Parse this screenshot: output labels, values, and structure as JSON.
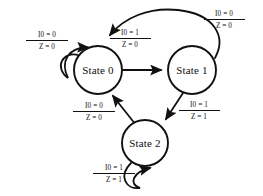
{
  "diagram": {
    "type": "finite-state-machine",
    "background_color": "#ffffff",
    "stroke_color": "#111111",
    "text_color": "#101010"
  },
  "states": [
    {
      "id": "state0",
      "label": "State 0",
      "cx": 98,
      "cy": 70,
      "r": 24
    },
    {
      "id": "state1",
      "label": "State 1",
      "cx": 192,
      "cy": 70,
      "r": 24
    },
    {
      "id": "state2",
      "label": "State 2",
      "cx": 145,
      "cy": 143,
      "r": 23
    }
  ],
  "transitions": [
    {
      "id": "t0",
      "from": "state0",
      "to": "state0",
      "kind": "self-loop",
      "input": "I0 = 0",
      "output": "Z = 0",
      "label_x": 47,
      "label_y": 40
    },
    {
      "id": "t1",
      "from": "state0",
      "to": "state1",
      "kind": "straight",
      "input": "I0 = 1",
      "output": "Z = 0",
      "label_x": 130,
      "label_y": 38
    },
    {
      "id": "t2",
      "from": "state1",
      "to": "state0",
      "kind": "arc",
      "input": "I0 = 0",
      "output": "Z = 0",
      "label_x": 222,
      "label_y": 19
    },
    {
      "id": "t3",
      "from": "state1",
      "to": "state2",
      "kind": "straight",
      "input": "I0 = 1",
      "output": "Z = 1",
      "label_x": 197,
      "label_y": 110
    },
    {
      "id": "t4",
      "from": "state2",
      "to": "state0",
      "kind": "straight",
      "input": "I0 = 0",
      "output": "Z = 0",
      "label_x": 94,
      "label_y": 111
    },
    {
      "id": "t5",
      "from": "state2",
      "to": "state2",
      "kind": "self-loop",
      "input": "I0 = 1",
      "output": "Z = 1",
      "label_x": 114,
      "label_y": 173
    }
  ]
}
